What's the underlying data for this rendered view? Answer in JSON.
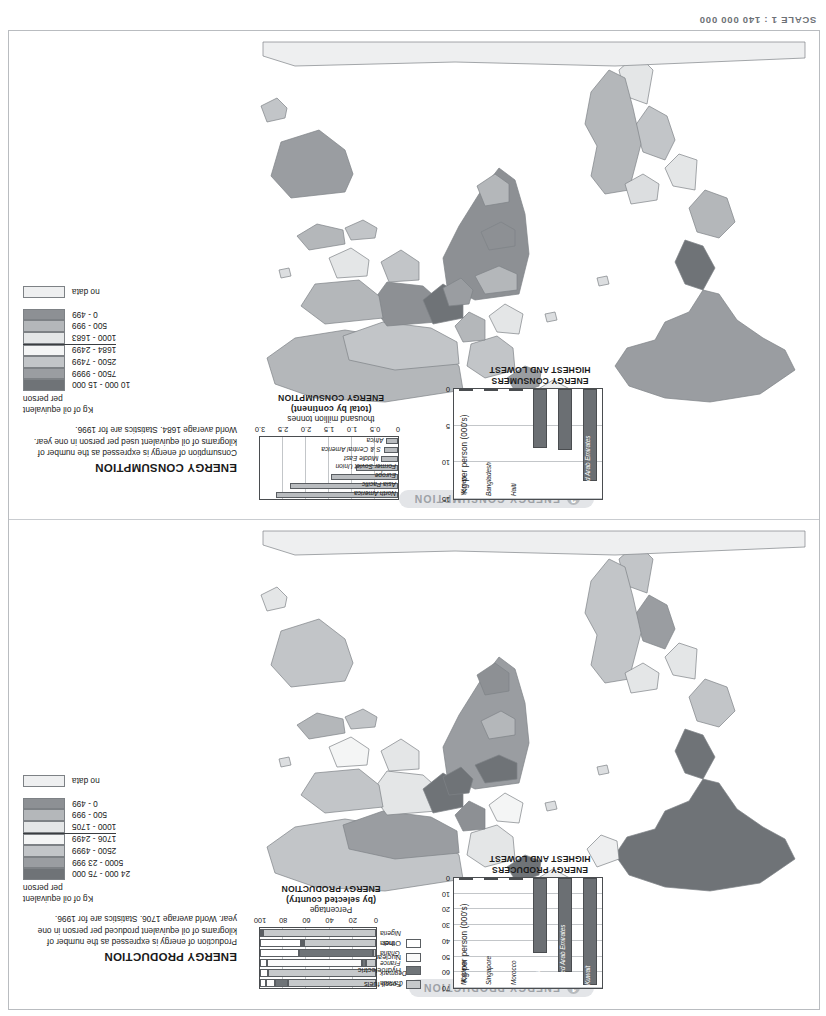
{
  "header": {
    "left": "",
    "scale": "SCALE 1 : 140 000 000"
  },
  "colors": {
    "class_0_499": "#8d9094",
    "class_500_999": "#b2b5b8",
    "class_1000_low": "#dcdee0",
    "class_mid": "#f2f3f4",
    "class_2500_4999": "#c9ccce",
    "class_5000_high": "#a0a3a6",
    "class_top": "#6f7377",
    "no_data": "#eeeff0",
    "fossil": "#c6c9cb",
    "hydro": "#6f7478",
    "nuclear": "#fafafa",
    "other": "#ffffff",
    "bar_fill": "#6b6f73",
    "pill_bg": "#e3e5e8",
    "pill_text": "#9da1a6"
  },
  "maps": [
    {
      "id": "production",
      "number": "1",
      "title": "ENERGY PRODUCTION",
      "legend": {
        "heading": "ENERGY PRODUCTION",
        "paragraph": "Production of energy is expressed as the number of kilograms of oil equivalent produced per person in one year. World average 1706. Statistics are for 1996.",
        "unit_line1": "Kg of oil equivalent",
        "unit_line2": "per person",
        "classes": [
          {
            "label": "24 000 - 75 000",
            "color": "#6f7377",
            "average_divider": false
          },
          {
            "label": "5000 - 23 999",
            "color": "#9a9da1",
            "average_divider": false
          },
          {
            "label": "2500 - 4999",
            "color": "#c2c5c8",
            "average_divider": false
          },
          {
            "label": "1706 - 2499",
            "color": "#f4f5f5",
            "average_divider": false
          },
          {
            "label": "1000 - 1705",
            "color": "#e4e6e7",
            "average_divider": true
          },
          {
            "label": "500 - 999",
            "color": "#b4b7ba",
            "average_divider": false
          },
          {
            "label": "0 - 499",
            "color": "#8d9094",
            "average_divider": false
          }
        ],
        "no_data_label": "no data",
        "no_data_color": "#eeeff0"
      }
    },
    {
      "id": "consumption",
      "number": "2",
      "title": "ENERGY CONSUMPTION",
      "legend": {
        "heading": "ENERGY CONSUMPTION",
        "paragraph": "Consumption of energy is expressed as the number of kilograms of oil equivalent used per person in one year. World average 1684. Statistics are for 1996.",
        "unit_line1": "Kg of oil equivalent",
        "unit_line2": "per person",
        "classes": [
          {
            "label": "10 000 - 15 000",
            "color": "#6f7377",
            "average_divider": false
          },
          {
            "label": "7500 - 9999",
            "color": "#9a9da1",
            "average_divider": false
          },
          {
            "label": "2500 - 7499",
            "color": "#c2c5c8",
            "average_divider": false
          },
          {
            "label": "1684 - 2499",
            "color": "#f4f5f5",
            "average_divider": false
          },
          {
            "label": "1000 - 1683",
            "color": "#e4e6e7",
            "average_divider": true
          },
          {
            "label": "500 - 999",
            "color": "#b4b7ba",
            "average_divider": false
          },
          {
            "label": "0 - 499",
            "color": "#8d9094",
            "average_divider": false
          }
        ],
        "no_data_label": "no data",
        "no_data_color": "#eeeff0"
      }
    }
  ],
  "chart_data": [
    {
      "id": "producers-high-low",
      "type": "bar",
      "title": "ENERGY PRODUCERS",
      "subtitle": "HIGHEST AND LOWEST",
      "ylabel": "Kg per person (000's)",
      "ylim": [
        0,
        70
      ],
      "yticks": [
        0,
        10,
        20,
        30,
        40,
        50,
        60,
        70
      ],
      "categories": [
        "Kuwait",
        "United Arab Emirates",
        "Norway",
        "Morocco",
        "Singapore",
        "Moldova"
      ],
      "values": [
        68,
        60,
        48,
        0.3,
        0.2,
        0.1
      ]
    },
    {
      "id": "production-by-country",
      "type": "bar",
      "title": "ENERGY PRODUCTION",
      "subtitle": "(by selected country)",
      "xlabel": "Percentage",
      "xlim": [
        0,
        100
      ],
      "xticks": [
        0,
        20,
        40,
        60,
        80,
        100
      ],
      "categories": [
        "Canada",
        "Denmark",
        "France",
        "Ghana",
        "India",
        "Nigeria"
      ],
      "legend": [
        "Fossil fuels",
        "Hydroelectric",
        "Nuclear",
        "Other"
      ],
      "series": [
        {
          "name": "Fossil fuels",
          "values": [
            76,
            93,
            9,
            3,
            62,
            97
          ]
        },
        {
          "name": "Hydroelectric",
          "values": [
            11,
            0,
            3,
            63,
            2,
            1
          ]
        },
        {
          "name": "Nuclear",
          "values": [
            8,
            0,
            82,
            0,
            1,
            0
          ]
        },
        {
          "name": "Other",
          "values": [
            5,
            7,
            6,
            34,
            35,
            2
          ]
        }
      ]
    },
    {
      "id": "consumers-high-low",
      "type": "bar",
      "title": "ENERGY CONSUMERS",
      "subtitle": "HIGHEST AND LOWEST",
      "ylabel": "Kg per person (000's)",
      "ylim": [
        0,
        15
      ],
      "yticks": [
        0,
        5,
        10,
        15
      ],
      "categories": [
        "United Arab Emirates",
        "Kuwait",
        "USA",
        "Haiti",
        "Bangladesh",
        "Yemen"
      ],
      "values": [
        12.6,
        8.3,
        8.1,
        0.25,
        0.2,
        0.18
      ]
    },
    {
      "id": "consumption-by-continent",
      "type": "bar",
      "title": "ENERGY CONSUMPTION",
      "subtitle": "(total by continent)",
      "xlabel": "thousand million tonnes",
      "xlim": [
        0,
        3.0
      ],
      "xticks": [
        "0",
        "0.5",
        "1.0",
        "1.5",
        "2.0",
        "2.5",
        "3.0"
      ],
      "categories": [
        "North America",
        "Asia Pacific",
        "Europe",
        "Former Soviet Union",
        "Middle East",
        "S & Central America",
        "Africa"
      ],
      "values": [
        2.65,
        2.35,
        1.45,
        0.92,
        0.36,
        0.31,
        0.25
      ]
    }
  ]
}
